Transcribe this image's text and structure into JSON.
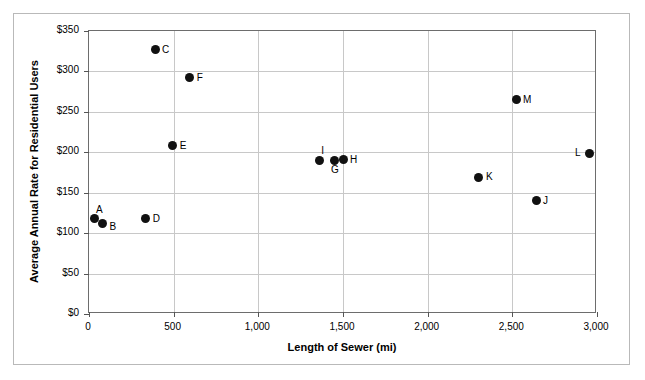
{
  "chart_data": {
    "type": "scatter",
    "title": "",
    "xlabel": "Length of Sewer (mi)",
    "ylabel": "Average Annual Rate for Residential Users",
    "xlim": [
      0,
      3000
    ],
    "ylim": [
      0,
      350
    ],
    "grid": true,
    "legend": "none",
    "x_ticks": [
      0,
      500,
      1000,
      1500,
      2000,
      2500,
      3000
    ],
    "x_tick_labels": [
      "0",
      "500",
      "1,000",
      "1,500",
      "2,000",
      "2,500",
      "3,000"
    ],
    "y_ticks": [
      0,
      50,
      100,
      150,
      200,
      250,
      300,
      350
    ],
    "y_tick_labels": [
      "$0",
      "$50",
      "$100",
      "$150",
      "$200",
      "$250",
      "$300",
      "$350"
    ],
    "points": [
      {
        "label": "A",
        "x": 30,
        "y": 118,
        "label_pos": "above-right"
      },
      {
        "label": "B",
        "x": 80,
        "y": 112,
        "label_pos": "right-below"
      },
      {
        "label": "C",
        "x": 390,
        "y": 327,
        "label_pos": "right"
      },
      {
        "label": "D",
        "x": 335,
        "y": 118,
        "label_pos": "right"
      },
      {
        "label": "E",
        "x": 495,
        "y": 208,
        "label_pos": "right"
      },
      {
        "label": "F",
        "x": 595,
        "y": 292,
        "label_pos": "right"
      },
      {
        "label": "G",
        "x": 1447,
        "y": 190,
        "label_pos": "below"
      },
      {
        "label": "H",
        "x": 1500,
        "y": 191,
        "label_pos": "right"
      },
      {
        "label": "I",
        "x": 1360,
        "y": 190,
        "label_pos": "above-right"
      },
      {
        "label": "J",
        "x": 2640,
        "y": 140,
        "label_pos": "right"
      },
      {
        "label": "K",
        "x": 2303,
        "y": 169,
        "label_pos": "right"
      },
      {
        "label": "L",
        "x": 2953,
        "y": 199,
        "label_pos": "left"
      },
      {
        "label": "M",
        "x": 2522,
        "y": 265,
        "label_pos": "right"
      }
    ]
  },
  "colors": {
    "marker": "#111111",
    "grid": "#c8c8c8",
    "axis": "#6d6d6d",
    "frame": "#b9b9b9",
    "text": "#000000"
  }
}
